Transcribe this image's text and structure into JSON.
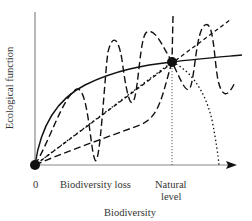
{
  "axes": {
    "y_label": "Ecological function",
    "x_label": "Biodiversity",
    "origin_label": "0",
    "x_tick_biodiversity_loss": "Biodiversity loss",
    "x_tick_natural_line1": "Natural",
    "x_tick_natural_line2": "level"
  },
  "colors": {
    "line": "#111111",
    "axis": "#777777",
    "background": "#ffffff"
  },
  "curves": [
    {
      "name": "saturating",
      "style": "solid"
    },
    {
      "name": "linear",
      "style": "short-dash"
    },
    {
      "name": "linear-then-collapse",
      "style": "dotted"
    },
    {
      "name": "sigmoid-lag",
      "style": "long-dash"
    },
    {
      "name": "idiosyncratic-oscillating",
      "style": "long-dash"
    }
  ],
  "points": [
    {
      "name": "origin",
      "label": "0"
    },
    {
      "name": "natural-level-point",
      "label": "Natural level"
    }
  ]
}
